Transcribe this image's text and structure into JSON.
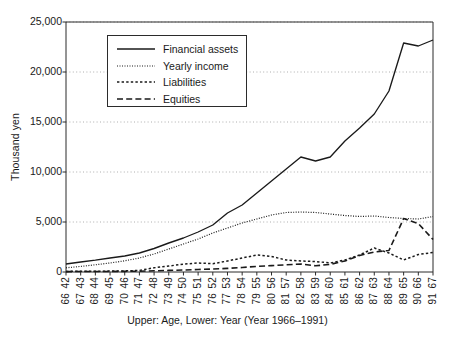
{
  "chart_data": {
    "type": "line",
    "title": "",
    "xlabel": "Upper: Age,   Lower: Year   (Year 1966–1991)",
    "ylabel": "Thousand yen",
    "ylim": [
      0,
      25000
    ],
    "yticks": [
      0,
      5000,
      10000,
      15000,
      20000,
      25000
    ],
    "ytick_labels": [
      "0",
      "5,000",
      "10,000",
      "15,000",
      "20,000",
      "25,000"
    ],
    "grid": "horizontal-dotted",
    "legend_position": "upper-left-inside",
    "x_upper_label": "Age",
    "x_lower_label": "Year",
    "categories_age": [
      "42",
      "43",
      "44",
      "45",
      "46",
      "47",
      "48",
      "49",
      "50",
      "51",
      "52",
      "53",
      "54",
      "55",
      "56",
      "57",
      "58",
      "59",
      "60",
      "61",
      "62",
      "63",
      "64",
      "65",
      "66",
      "67"
    ],
    "categories_year": [
      "66",
      "67",
      "68",
      "69",
      "70",
      "71",
      "72",
      "73",
      "74",
      "75",
      "76",
      "77",
      "78",
      "79",
      "80",
      "81",
      "82",
      "83",
      "84",
      "85",
      "86",
      "87",
      "88",
      "89",
      "90",
      "91"
    ],
    "series": [
      {
        "name": "Financial assets",
        "style": "solid",
        "values": [
          800,
          1000,
          1180,
          1400,
          1600,
          1900,
          2350,
          2900,
          3400,
          4000,
          4700,
          5900,
          6700,
          7900,
          9100,
          10300,
          11500,
          11100,
          11500,
          13100,
          14400,
          15800,
          18100,
          22900,
          22600,
          23200
        ]
      },
      {
        "name": "Yearly income",
        "style": "fine-dotted",
        "values": [
          420,
          560,
          720,
          900,
          1120,
          1400,
          1800,
          2300,
          2800,
          3300,
          3900,
          4400,
          4900,
          5300,
          5700,
          5950,
          6000,
          5950,
          5800,
          5650,
          5550,
          5600,
          5450,
          5350,
          5300,
          5550
        ]
      },
      {
        "name": "Liabilities",
        "style": "coarse-dotted",
        "values": [
          60,
          70,
          80,
          90,
          110,
          160,
          420,
          600,
          780,
          900,
          830,
          1100,
          1400,
          1700,
          1550,
          1200,
          1100,
          1050,
          900,
          1200,
          1700,
          2400,
          1900,
          1200,
          1750,
          1950
        ]
      },
      {
        "name": "Equities",
        "style": "dashed",
        "values": [
          40,
          45,
          50,
          55,
          65,
          80,
          120,
          160,
          200,
          250,
          300,
          360,
          450,
          560,
          640,
          720,
          800,
          620,
          760,
          1100,
          1650,
          2000,
          2150,
          5350,
          4850,
          3250
        ]
      }
    ]
  },
  "legend": {
    "items": [
      {
        "label": "Financial assets",
        "style": "solid"
      },
      {
        "label": "Yearly income",
        "style": "fine-dotted"
      },
      {
        "label": "Liabilities",
        "style": "coarse-dotted"
      },
      {
        "label": "Equities",
        "style": "dashed"
      }
    ]
  },
  "axes": {
    "y_title": "Thousand yen",
    "x_caption": "Upper: Age,   Lower: Year   (Year 1966–1991)"
  }
}
